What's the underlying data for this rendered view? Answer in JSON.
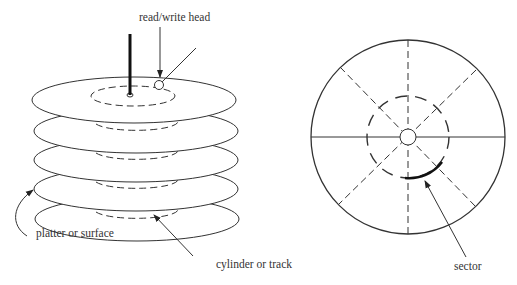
{
  "labels": {
    "head": "read/write head",
    "platter": "platter or surface",
    "cylinder": "cylinder or track",
    "sector": "sector"
  },
  "diagram": {
    "left": {
      "description": "Stack of disk platters on a spindle",
      "platter_count": 5
    },
    "right": {
      "description": "Top view of a platter divided into sectors with a track"
    }
  },
  "colors": {
    "line": "#333333",
    "background": "#ffffff"
  }
}
